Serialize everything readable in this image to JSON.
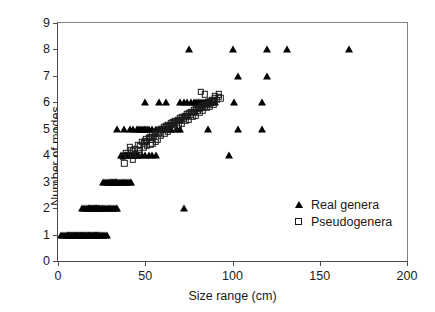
{
  "chart_data": {
    "type": "scatter",
    "title": "",
    "xlabel": "Size range (cm)",
    "ylabel": "Number of modes",
    "xlim": [
      0,
      200
    ],
    "ylim": [
      0,
      9
    ],
    "xticks": [
      0,
      50,
      100,
      150,
      200
    ],
    "yticks": [
      0,
      1,
      2,
      3,
      4,
      5,
      6,
      7,
      8,
      9
    ],
    "grid": false,
    "legend_position": "lower-right",
    "series": [
      {
        "name": "Real genera",
        "marker": "filled-triangle",
        "color": "#000000",
        "points": [
          [
            2,
            1
          ],
          [
            3,
            1
          ],
          [
            4,
            1
          ],
          [
            5,
            1
          ],
          [
            5.5,
            1
          ],
          [
            6,
            1
          ],
          [
            6.5,
            1
          ],
          [
            7,
            1
          ],
          [
            7.5,
            1
          ],
          [
            8,
            1
          ],
          [
            8.5,
            1
          ],
          [
            9,
            1
          ],
          [
            9.5,
            1
          ],
          [
            10,
            1
          ],
          [
            10.5,
            1
          ],
          [
            11,
            1
          ],
          [
            11.5,
            1
          ],
          [
            12,
            1
          ],
          [
            12.5,
            1
          ],
          [
            13,
            1
          ],
          [
            13.5,
            1
          ],
          [
            14,
            1
          ],
          [
            14.5,
            1
          ],
          [
            15,
            1
          ],
          [
            15.5,
            1
          ],
          [
            16,
            1
          ],
          [
            16.5,
            1
          ],
          [
            17,
            1
          ],
          [
            17.5,
            1
          ],
          [
            18,
            1
          ],
          [
            18.5,
            1
          ],
          [
            19,
            1
          ],
          [
            19.5,
            1
          ],
          [
            20,
            1
          ],
          [
            20.5,
            1
          ],
          [
            21,
            1
          ],
          [
            21.5,
            1
          ],
          [
            22,
            1
          ],
          [
            22.5,
            1
          ],
          [
            23,
            1
          ],
          [
            23.5,
            1
          ],
          [
            24,
            1
          ],
          [
            25,
            1
          ],
          [
            26,
            1
          ],
          [
            27,
            1
          ],
          [
            28,
            1
          ],
          [
            14,
            2
          ],
          [
            15,
            2
          ],
          [
            16,
            2
          ],
          [
            17,
            2
          ],
          [
            17.5,
            2
          ],
          [
            18,
            2
          ],
          [
            18.5,
            2
          ],
          [
            19,
            2
          ],
          [
            19.5,
            2
          ],
          [
            20,
            2
          ],
          [
            20.5,
            2
          ],
          [
            21,
            2
          ],
          [
            21.5,
            2
          ],
          [
            22,
            2
          ],
          [
            22.5,
            2
          ],
          [
            23,
            2
          ],
          [
            23.5,
            2
          ],
          [
            24,
            2
          ],
          [
            25,
            2
          ],
          [
            26,
            2
          ],
          [
            27,
            2
          ],
          [
            28,
            2
          ],
          [
            29,
            2
          ],
          [
            30,
            2
          ],
          [
            31,
            2
          ],
          [
            32,
            2
          ],
          [
            33,
            2
          ],
          [
            34,
            2
          ],
          [
            72,
            2
          ],
          [
            26,
            3
          ],
          [
            27,
            3
          ],
          [
            28,
            3
          ],
          [
            29,
            3
          ],
          [
            30,
            3
          ],
          [
            30.5,
            3
          ],
          [
            31,
            3
          ],
          [
            31.5,
            3
          ],
          [
            32,
            3
          ],
          [
            32.5,
            3
          ],
          [
            33,
            3
          ],
          [
            33.5,
            3
          ],
          [
            34,
            3
          ],
          [
            35,
            3
          ],
          [
            36,
            3
          ],
          [
            37,
            3
          ],
          [
            38,
            3
          ],
          [
            39,
            3
          ],
          [
            40,
            3
          ],
          [
            41,
            3
          ],
          [
            42,
            3
          ],
          [
            36,
            4
          ],
          [
            37,
            4
          ],
          [
            38,
            4
          ],
          [
            38.5,
            4
          ],
          [
            39,
            4
          ],
          [
            39.5,
            4
          ],
          [
            40,
            4
          ],
          [
            41,
            4
          ],
          [
            42,
            4
          ],
          [
            43,
            4
          ],
          [
            44,
            4
          ],
          [
            45,
            4
          ],
          [
            46,
            4
          ],
          [
            48,
            4
          ],
          [
            50,
            4
          ],
          [
            52,
            4
          ],
          [
            54,
            4
          ],
          [
            56,
            4
          ],
          [
            98,
            4
          ],
          [
            34,
            5
          ],
          [
            38,
            5
          ],
          [
            41,
            5
          ],
          [
            43,
            5
          ],
          [
            45,
            5
          ],
          [
            46,
            5
          ],
          [
            47,
            5
          ],
          [
            48,
            5
          ],
          [
            49,
            5
          ],
          [
            50,
            5
          ],
          [
            51,
            5
          ],
          [
            52,
            5
          ],
          [
            54,
            5
          ],
          [
            56,
            5
          ],
          [
            58,
            5
          ],
          [
            60,
            5
          ],
          [
            62,
            5
          ],
          [
            65,
            5
          ],
          [
            68,
            5
          ],
          [
            70,
            5
          ],
          [
            86,
            5
          ],
          [
            103,
            5
          ],
          [
            117,
            5
          ],
          [
            50,
            6
          ],
          [
            58,
            6
          ],
          [
            62,
            6
          ],
          [
            70,
            6
          ],
          [
            72,
            6
          ],
          [
            74,
            6
          ],
          [
            76,
            6
          ],
          [
            78,
            6
          ],
          [
            79,
            6
          ],
          [
            80,
            6
          ],
          [
            81,
            6
          ],
          [
            82,
            6
          ],
          [
            83,
            6
          ],
          [
            84,
            6
          ],
          [
            85,
            6
          ],
          [
            86,
            6
          ],
          [
            87,
            6
          ],
          [
            88,
            6
          ],
          [
            90,
            6
          ],
          [
            101,
            6
          ],
          [
            117,
            6
          ],
          [
            103,
            7
          ],
          [
            120,
            7
          ],
          [
            75,
            8
          ],
          [
            100,
            8
          ],
          [
            120,
            8
          ],
          [
            131,
            8
          ],
          [
            167,
            8
          ]
        ]
      },
      {
        "name": "Pseudogenera",
        "marker": "open-square",
        "color": "#1a1a1a",
        "points": [
          [
            38,
            3.7
          ],
          [
            43,
            3.85
          ],
          [
            45,
            4.0
          ],
          [
            41,
            4.3
          ],
          [
            44,
            4.25
          ],
          [
            46,
            4.4
          ],
          [
            47,
            4.35
          ],
          [
            48,
            4.5
          ],
          [
            49,
            4.45
          ],
          [
            50,
            4.55
          ],
          [
            50.5,
            4.6
          ],
          [
            51,
            4.5
          ],
          [
            52,
            4.65
          ],
          [
            52.5,
            4.7
          ],
          [
            53,
            4.6
          ],
          [
            54,
            4.75
          ],
          [
            55,
            4.7
          ],
          [
            55.5,
            4.85
          ],
          [
            56,
            4.8
          ],
          [
            57,
            4.9
          ],
          [
            58,
            4.85
          ],
          [
            58.5,
            4.95
          ],
          [
            59,
            5.0
          ],
          [
            60,
            4.95
          ],
          [
            60.5,
            5.05
          ],
          [
            61,
            5.0
          ],
          [
            62,
            5.1
          ],
          [
            62.5,
            5.05
          ],
          [
            63,
            5.15
          ],
          [
            64,
            5.1
          ],
          [
            64.5,
            5.2
          ],
          [
            65,
            5.15
          ],
          [
            66,
            5.25
          ],
          [
            66.5,
            5.2
          ],
          [
            67,
            5.3
          ],
          [
            68,
            5.25
          ],
          [
            68.5,
            5.35
          ],
          [
            69,
            5.3
          ],
          [
            70,
            5.4
          ],
          [
            70.5,
            5.35
          ],
          [
            71,
            5.45
          ],
          [
            72,
            5.4
          ],
          [
            72.5,
            5.5
          ],
          [
            73,
            5.45
          ],
          [
            74,
            5.55
          ],
          [
            74.5,
            5.5
          ],
          [
            75,
            5.6
          ],
          [
            76,
            5.55
          ],
          [
            76.5,
            5.65
          ],
          [
            77,
            5.6
          ],
          [
            78,
            5.7
          ],
          [
            78.5,
            5.65
          ],
          [
            79,
            5.75
          ],
          [
            80,
            5.7
          ],
          [
            80.5,
            5.8
          ],
          [
            81,
            5.75
          ],
          [
            82,
            5.85
          ],
          [
            82.5,
            5.8
          ],
          [
            83,
            5.9
          ],
          [
            84,
            5.85
          ],
          [
            84.5,
            5.95
          ],
          [
            85,
            5.9
          ],
          [
            86,
            6.0
          ],
          [
            86.5,
            5.95
          ],
          [
            87,
            6.05
          ],
          [
            88,
            6.0
          ],
          [
            88.5,
            6.1
          ],
          [
            89,
            6.05
          ],
          [
            90,
            6.15
          ],
          [
            91,
            6.1
          ],
          [
            92,
            6.2
          ],
          [
            93,
            6.15
          ],
          [
            44,
            4.05
          ],
          [
            46,
            4.1
          ],
          [
            43,
            4.15
          ],
          [
            42,
            4.2
          ],
          [
            53,
            4.4
          ],
          [
            54,
            4.45
          ],
          [
            56,
            4.5
          ],
          [
            57,
            4.6
          ],
          [
            59,
            4.75
          ],
          [
            61,
            4.8
          ],
          [
            63,
            4.9
          ],
          [
            65,
            4.95
          ],
          [
            67,
            5.05
          ],
          [
            69,
            5.1
          ],
          [
            71,
            5.2
          ],
          [
            73,
            5.3
          ],
          [
            75,
            5.35
          ],
          [
            77,
            5.45
          ],
          [
            79,
            5.5
          ],
          [
            81,
            5.6
          ],
          [
            83,
            5.7
          ],
          [
            85,
            5.8
          ],
          [
            87,
            5.85
          ],
          [
            89,
            5.9
          ],
          [
            82,
            6.4
          ],
          [
            84,
            6.3
          ],
          [
            90,
            6.25
          ],
          [
            92,
            6.3
          ],
          [
            47,
            4.2
          ],
          [
            49,
            4.3
          ],
          [
            51,
            4.35
          ],
          [
            40,
            4.0
          ],
          [
            39,
            4.1
          ],
          [
            37,
            3.95
          ]
        ]
      }
    ]
  },
  "legend": {
    "items": [
      {
        "label": "Real genera",
        "marker": "filled-triangle"
      },
      {
        "label": "Pseudogenera",
        "marker": "open-square"
      }
    ]
  }
}
